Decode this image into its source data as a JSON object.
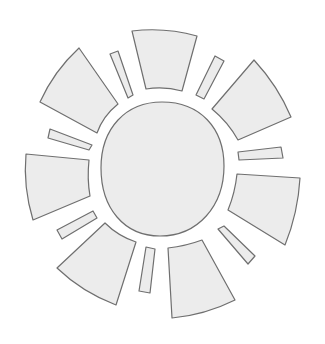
{
  "diagram": {
    "colors": {
      "fill": "#ececec",
      "stroke": "#6f6f6f",
      "background": "#ffffff"
    },
    "parts": {
      "center": "sun-disc",
      "wide_rays": [
        "top",
        "top-right",
        "right",
        "bottom",
        "bottom-left",
        "left",
        "top-left"
      ],
      "thin_rays": [
        "top-left",
        "top-right",
        "right",
        "bottom-right",
        "bottom",
        "bottom-left",
        "left"
      ]
    }
  }
}
